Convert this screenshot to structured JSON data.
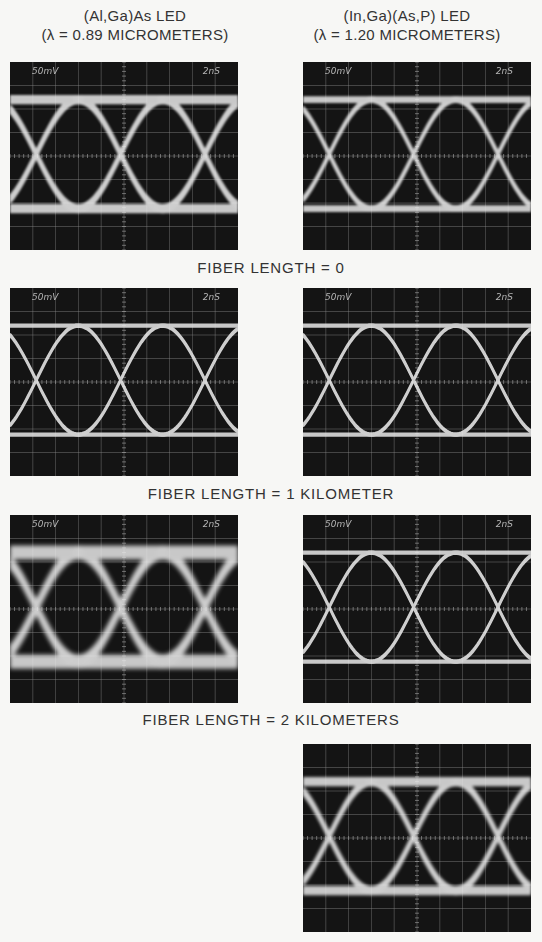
{
  "columns": [
    {
      "title_line1": "(Al,Ga)As  LED",
      "title_line2": "(λ = 0.89 MICROMETERS)"
    },
    {
      "title_line1": "(In,Ga)(As,P)  LED",
      "title_line2": "(λ = 1.20 MICROMETERS)"
    }
  ],
  "rows": [
    {
      "caption": "FIBER LENGTH = 0"
    },
    {
      "caption": "FIBER LENGTH = 1 KILOMETER"
    },
    {
      "caption": "FIBER LENGTH = 2 KILOMETERS"
    }
  ],
  "scope": {
    "volts_per_div": "50mV",
    "time_per_div": "2nS",
    "grid_cols": 10,
    "grid_rows": 8
  },
  "panels": [
    {
      "id": "al-0km",
      "column": 0,
      "fiber_length": "0",
      "volts": "50mV",
      "time": "2nS",
      "blur": 1.2,
      "spread": 3
    },
    {
      "id": "in-0km",
      "column": 1,
      "fiber_length": "0",
      "volts": "50mV",
      "time": "2nS",
      "blur": 1.0,
      "spread": 2
    },
    {
      "id": "al-1km",
      "column": 0,
      "fiber_length": "1 km",
      "volts": "50mV",
      "time": "2nS",
      "blur": 0.6,
      "spread": 1
    },
    {
      "id": "in-1km",
      "column": 1,
      "fiber_length": "1 km",
      "volts": "50mV",
      "time": "2nS",
      "blur": 0.6,
      "spread": 1
    },
    {
      "id": "al-2km",
      "column": 0,
      "fiber_length": "2 km",
      "volts": "50mV",
      "time": "2nS",
      "blur": 2.2,
      "spread": 5
    },
    {
      "id": "in-2km",
      "column": 1,
      "fiber_length": "2 km",
      "volts": "50mV",
      "time": "2nS",
      "blur": 0.7,
      "spread": 1
    },
    {
      "id": "in-2km-b",
      "column": 1,
      "fiber_length": "2 km",
      "volts": "",
      "time": "",
      "blur": 1.6,
      "spread": 3
    }
  ]
}
